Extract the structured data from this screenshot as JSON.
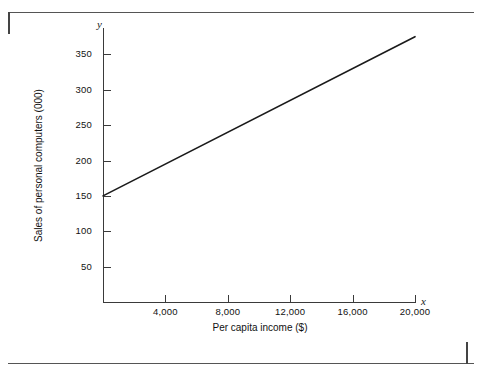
{
  "chart_data": {
    "type": "line",
    "title": "",
    "xlabel": "Per capita income ($)",
    "ylabel": "Sales of personal computers (000)",
    "x_axis_symbol": "x",
    "y_axis_symbol": "y",
    "xlim": [
      0,
      20000
    ],
    "ylim": [
      0,
      400
    ],
    "grid": false,
    "legend": "none",
    "x_ticks": [
      {
        "value": 4000,
        "label": "4,000"
      },
      {
        "value": 8000,
        "label": "8,000"
      },
      {
        "value": 12000,
        "label": "12,000"
      },
      {
        "value": 16000,
        "label": "16,000"
      },
      {
        "value": 20000,
        "label": "20,000"
      }
    ],
    "y_ticks": [
      {
        "value": 50,
        "label": "50"
      },
      {
        "value": 100,
        "label": "100"
      },
      {
        "value": 150,
        "label": "150"
      },
      {
        "value": 200,
        "label": "200"
      },
      {
        "value": 250,
        "label": "250"
      },
      {
        "value": 300,
        "label": "300"
      },
      {
        "value": 350,
        "label": "350"
      }
    ],
    "series": [
      {
        "name": "Sales of personal computers",
        "x": [
          0,
          20000
        ],
        "values": [
          150,
          375
        ],
        "color": "#1a1a1a"
      }
    ]
  }
}
